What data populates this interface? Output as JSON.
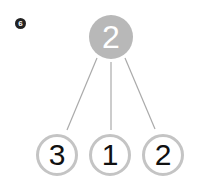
{
  "problem_number": "6",
  "top_node": {
    "value": "2",
    "fill": "#b8b8b8"
  },
  "bottom_nodes": [
    {
      "value": "3"
    },
    {
      "value": "1"
    },
    {
      "value": "2"
    }
  ],
  "line_color": "#aaaaaa"
}
